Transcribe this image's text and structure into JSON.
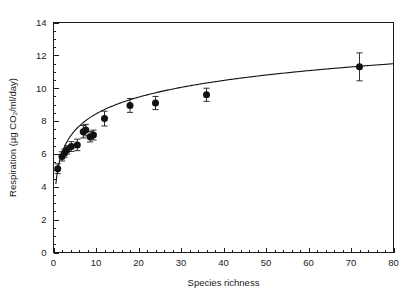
{
  "chart_data": {
    "type": "scatter",
    "title": "",
    "xlabel": "Species richness",
    "ylabel": "Respiration (µg CO₂/ml/day)",
    "xlim": [
      0,
      80
    ],
    "ylim": [
      0,
      14
    ],
    "xticks": [
      0,
      10,
      20,
      30,
      40,
      50,
      60,
      70,
      80
    ],
    "yticks": [
      0,
      2,
      4,
      6,
      8,
      10,
      12,
      14
    ],
    "xtick_labels": [
      "0",
      "10",
      "20",
      "30",
      "40",
      "50",
      "60",
      "70",
      "80"
    ],
    "ytick_labels": [
      "0",
      "2",
      "4",
      "6",
      "8",
      "10",
      "12",
      "14"
    ],
    "x_minor_step": 2,
    "y_minor_step": 0.5,
    "grid": false,
    "legend": null,
    "marker_style": "filled-circle",
    "error_bar_style": "vertical-capped",
    "frame": [
      "left",
      "bottom",
      "top",
      "right"
    ],
    "points": [
      {
        "x": 1.0,
        "y": 5.1,
        "yerr": 0.3
      },
      {
        "x": 2.0,
        "y": 5.85,
        "yerr": 0.28
      },
      {
        "x": 2.6,
        "y": 6.05,
        "yerr": 0.25
      },
      {
        "x": 3.2,
        "y": 6.25,
        "yerr": 0.25
      },
      {
        "x": 4.2,
        "y": 6.45,
        "yerr": 0.3
      },
      {
        "x": 5.6,
        "y": 6.55,
        "yerr": 0.35
      },
      {
        "x": 7.0,
        "y": 7.35,
        "yerr": 0.38
      },
      {
        "x": 7.6,
        "y": 7.45,
        "yerr": 0.35
      },
      {
        "x": 8.6,
        "y": 7.05,
        "yerr": 0.32
      },
      {
        "x": 9.4,
        "y": 7.15,
        "yerr": 0.3
      },
      {
        "x": 12.0,
        "y": 8.15,
        "yerr": 0.45
      },
      {
        "x": 18.0,
        "y": 8.95,
        "yerr": 0.42
      },
      {
        "x": 24.0,
        "y": 9.1,
        "yerr": 0.4
      },
      {
        "x": 36.0,
        "y": 9.6,
        "yerr": 0.4
      },
      {
        "x": 72.0,
        "y": 11.3,
        "yerr": 0.85
      }
    ],
    "fit": {
      "form": "logarithmic",
      "label": "",
      "intercept": 5.05,
      "slope": 1.47,
      "x_start": 0.55,
      "x_end": 80.0
    }
  },
  "colors": {
    "marker": "#111111",
    "line": "#111111",
    "axis": "#1a1a1a",
    "background": "#ffffff"
  }
}
